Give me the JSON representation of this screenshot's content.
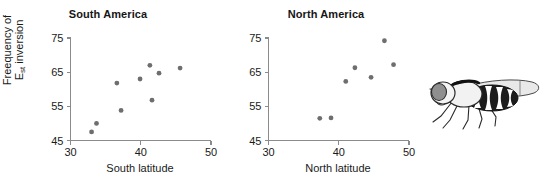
{
  "figure": {
    "background_color": "#ffffff",
    "point_color": "#6e6e6e",
    "axis_color": "#8b8b8b",
    "text_color": "#1a1a1a",
    "ylabel_line1": "Freequency of",
    "ylabel_line2_prefix": "E",
    "ylabel_line2_sub": "st",
    "ylabel_line2_suffix": " inversion",
    "illustration_name": "drosophila-fly-illustration"
  },
  "chart_data": [
    {
      "type": "scatter",
      "title": "South America",
      "xlabel": "South latitude",
      "ylabel": "Freequency of Est inversion",
      "xlim": [
        30,
        50
      ],
      "ylim": [
        45,
        75
      ],
      "xticks": [
        30,
        40,
        50
      ],
      "yticks": [
        45,
        55,
        65,
        75
      ],
      "xtick_labels": [
        "30",
        "40",
        "50"
      ],
      "ytick_labels": [
        "45",
        "55",
        "65",
        "75"
      ],
      "grid": false,
      "legend": null,
      "points": [
        {
          "x": 33.0,
          "y": 47.5
        },
        {
          "x": 33.7,
          "y": 50.0
        },
        {
          "x": 36.6,
          "y": 61.8
        },
        {
          "x": 37.2,
          "y": 53.8
        },
        {
          "x": 39.9,
          "y": 63.0
        },
        {
          "x": 41.3,
          "y": 67.0
        },
        {
          "x": 41.6,
          "y": 56.8
        },
        {
          "x": 42.6,
          "y": 64.7
        },
        {
          "x": 45.6,
          "y": 66.2
        }
      ]
    },
    {
      "type": "scatter",
      "title": "North America",
      "xlabel": "North latitude",
      "ylabel": "Freequency of Est inversion",
      "xlim": [
        30,
        50
      ],
      "ylim": [
        45,
        75
      ],
      "xticks": [
        30,
        40,
        50
      ],
      "yticks": [
        45,
        55,
        65,
        75
      ],
      "xtick_labels": [
        "30",
        "40",
        "50"
      ],
      "ytick_labels": [
        "45",
        "55",
        "65",
        "75"
      ],
      "grid": false,
      "legend": null,
      "points": [
        {
          "x": 37.3,
          "y": 51.5
        },
        {
          "x": 38.9,
          "y": 51.6
        },
        {
          "x": 41.0,
          "y": 62.3
        },
        {
          "x": 42.3,
          "y": 66.3
        },
        {
          "x": 44.6,
          "y": 63.5
        },
        {
          "x": 46.5,
          "y": 74.2
        },
        {
          "x": 47.8,
          "y": 67.2
        }
      ]
    }
  ]
}
